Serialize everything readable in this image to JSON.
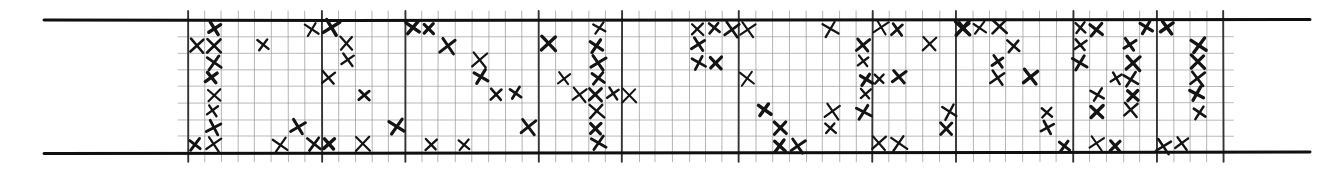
{
  "document": {
    "kind": "hand-drawn-tally-dot-plot",
    "title": "",
    "description": "Hand-drawn X-mark dot plot on ruled grid paper between two heavy horizontal rules"
  },
  "ink": {
    "mark_color": "#141414",
    "grid_color": "#8f8f8f",
    "heavy_grid_color": "#2a2a2a",
    "rule_color": "#101010",
    "paper_color": "#ffffff"
  },
  "chart_data": {
    "type": "scatter",
    "title": "",
    "subtitle": "",
    "xlabel": "",
    "ylabel": "",
    "legend": [],
    "grid": true,
    "marker": "x",
    "n_columns": 62,
    "n_rows": 8,
    "xlim": [
      0,
      62
    ],
    "ylim": [
      0,
      8
    ],
    "column_pitch_px": 16.7,
    "row_pitch_px": 16.6,
    "grid_origin_px": [
      188,
      20
    ],
    "heavy_column_lines": [
      0,
      8,
      13,
      21,
      26,
      33,
      41,
      46,
      53,
      58,
      62
    ],
    "annotations": [],
    "counts_per_column": [
      1,
      8,
      0,
      1,
      2,
      1,
      2,
      3,
      3,
      1,
      3,
      0,
      1,
      1,
      2,
      1,
      3,
      2,
      2,
      2,
      1,
      3,
      2,
      1,
      8,
      1,
      2,
      2,
      3,
      2,
      1,
      2,
      1,
      2,
      4,
      1,
      2,
      5,
      2,
      1,
      2,
      2,
      3,
      1,
      1,
      2,
      2,
      2,
      2,
      1,
      1,
      3,
      3,
      1,
      2,
      1,
      6,
      2,
      1,
      4,
      3,
      6
    ],
    "points": [
      {
        "c": 0,
        "r": 1
      },
      {
        "c": 0,
        "r": 7
      },
      {
        "c": 1,
        "r": 0
      },
      {
        "c": 1,
        "r": 1
      },
      {
        "c": 1,
        "r": 2
      },
      {
        "c": 1,
        "r": 3
      },
      {
        "c": 1,
        "r": 4
      },
      {
        "c": 1,
        "r": 5
      },
      {
        "c": 1,
        "r": 6
      },
      {
        "c": 1,
        "r": 7
      },
      {
        "c": 4,
        "r": 1
      },
      {
        "c": 5,
        "r": 7
      },
      {
        "c": 6,
        "r": 6
      },
      {
        "c": 7,
        "r": 0
      },
      {
        "c": 7,
        "r": 7
      },
      {
        "c": 8,
        "r": 0
      },
      {
        "c": 8,
        "r": 3
      },
      {
        "c": 8,
        "r": 7
      },
      {
        "c": 9,
        "r": 1
      },
      {
        "c": 9,
        "r": 2
      },
      {
        "c": 10,
        "r": 4
      },
      {
        "c": 10,
        "r": 7
      },
      {
        "c": 12,
        "r": 6
      },
      {
        "c": 13,
        "r": 0
      },
      {
        "c": 14,
        "r": 0
      },
      {
        "c": 14,
        "r": 7
      },
      {
        "c": 15,
        "r": 1
      },
      {
        "c": 16,
        "r": 7
      },
      {
        "c": 17,
        "r": 2
      },
      {
        "c": 17,
        "r": 3
      },
      {
        "c": 18,
        "r": 4
      },
      {
        "c": 19,
        "r": 4
      },
      {
        "c": 20,
        "r": 6
      },
      {
        "c": 21,
        "r": 1
      },
      {
        "c": 22,
        "r": 3
      },
      {
        "c": 23,
        "r": 4
      },
      {
        "c": 24,
        "r": 0
      },
      {
        "c": 24,
        "r": 1
      },
      {
        "c": 24,
        "r": 2
      },
      {
        "c": 24,
        "r": 3
      },
      {
        "c": 24,
        "r": 4
      },
      {
        "c": 24,
        "r": 5
      },
      {
        "c": 24,
        "r": 6
      },
      {
        "c": 24,
        "r": 7
      },
      {
        "c": 25,
        "r": 4
      },
      {
        "c": 26,
        "r": 4
      },
      {
        "c": 30,
        "r": 0
      },
      {
        "c": 30,
        "r": 1
      },
      {
        "c": 30,
        "r": 2
      },
      {
        "c": 31,
        "r": 0
      },
      {
        "c": 31,
        "r": 2
      },
      {
        "c": 32,
        "r": 0
      },
      {
        "c": 33,
        "r": 0
      },
      {
        "c": 33,
        "r": 3
      },
      {
        "c": 34,
        "r": 5
      },
      {
        "c": 35,
        "r": 6
      },
      {
        "c": 35,
        "r": 7
      },
      {
        "c": 36,
        "r": 7
      },
      {
        "c": 38,
        "r": 0
      },
      {
        "c": 38,
        "r": 5
      },
      {
        "c": 38,
        "r": 6
      },
      {
        "c": 40,
        "r": 1
      },
      {
        "c": 40,
        "r": 2
      },
      {
        "c": 40,
        "r": 3
      },
      {
        "c": 40,
        "r": 4
      },
      {
        "c": 40,
        "r": 5
      },
      {
        "c": 41,
        "r": 0
      },
      {
        "c": 41,
        "r": 3
      },
      {
        "c": 41,
        "r": 7
      },
      {
        "c": 42,
        "r": 0
      },
      {
        "c": 42,
        "r": 3
      },
      {
        "c": 42,
        "r": 7
      },
      {
        "c": 44,
        "r": 1
      },
      {
        "c": 45,
        "r": 5
      },
      {
        "c": 45,
        "r": 6
      },
      {
        "c": 46,
        "r": 0
      },
      {
        "c": 46,
        "r": 0
      },
      {
        "c": 47,
        "r": 0
      },
      {
        "c": 48,
        "r": 0
      },
      {
        "c": 48,
        "r": 2
      },
      {
        "c": 48,
        "r": 3
      },
      {
        "c": 49,
        "r": 1
      },
      {
        "c": 50,
        "r": 3
      },
      {
        "c": 51,
        "r": 5
      },
      {
        "c": 51,
        "r": 6
      },
      {
        "c": 52,
        "r": 7
      },
      {
        "c": 53,
        "r": 0
      },
      {
        "c": 53,
        "r": 1
      },
      {
        "c": 53,
        "r": 2
      },
      {
        "c": 54,
        "r": 0
      },
      {
        "c": 54,
        "r": 4
      },
      {
        "c": 54,
        "r": 5
      },
      {
        "c": 54,
        "r": 7
      },
      {
        "c": 55,
        "r": 3
      },
      {
        "c": 55,
        "r": 7
      },
      {
        "c": 56,
        "r": 1
      },
      {
        "c": 56,
        "r": 2
      },
      {
        "c": 56,
        "r": 3
      },
      {
        "c": 56,
        "r": 4
      },
      {
        "c": 56,
        "r": 5
      },
      {
        "c": 57,
        "r": 0
      },
      {
        "c": 58,
        "r": 0
      },
      {
        "c": 58,
        "r": 7
      },
      {
        "c": 59,
        "r": 7
      },
      {
        "c": 60,
        "r": 1
      },
      {
        "c": 60,
        "r": 2
      },
      {
        "c": 60,
        "r": 3
      },
      {
        "c": 60,
        "r": 4
      },
      {
        "c": 60,
        "r": 5
      }
    ]
  },
  "rules": {
    "top_rule": {
      "y": 20,
      "x1": 44,
      "x2": 1310,
      "thickness": 3
    },
    "bottom_rule": {
      "y": 153,
      "x1": 44,
      "x2": 1310,
      "thickness": 3
    }
  }
}
